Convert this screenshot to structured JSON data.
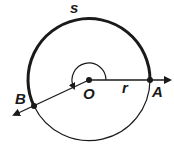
{
  "diagram": {
    "type": "circle-arc-angle",
    "colors": {
      "stroke": "#1a1a1a",
      "background": "#ffffff"
    },
    "labels": {
      "arc": "s",
      "center": "O",
      "radius": "r",
      "point_a": "A",
      "point_b": "B"
    },
    "points": {
      "O": {
        "x": 89,
        "y": 80
      },
      "A": {
        "x": 150,
        "y": 80
      },
      "B": {
        "x": 34,
        "y": 106
      }
    },
    "radius_px": 61
  }
}
